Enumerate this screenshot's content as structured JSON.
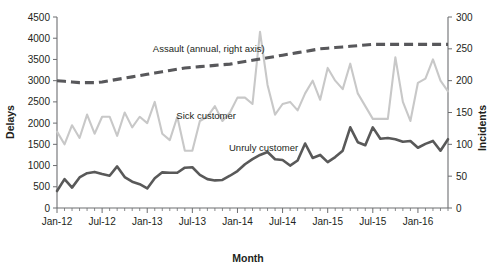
{
  "chart_data": {
    "type": "line",
    "title": "",
    "xlabel": "Month",
    "ylabel": "Delays",
    "y2label": "Incidents",
    "grid": false,
    "legend_position": "inline-annotations",
    "ylim": [
      0,
      4500
    ],
    "yticks": [
      "0",
      "500",
      "1000",
      "1500",
      "2000",
      "2500",
      "3000",
      "3500",
      "4000",
      "4500"
    ],
    "y2lim": [
      0,
      300
    ],
    "y2ticks": [
      "0",
      "50",
      "100",
      "150",
      "200",
      "250",
      "300"
    ],
    "xticks": [
      "Jan-12",
      "Jul-12",
      "Jan-13",
      "Jul-13",
      "Jan-14",
      "Jul-14",
      "Jan-15",
      "Jul-15",
      "Jan-16"
    ],
    "x_start": "Jan-12",
    "x_end": "May-16",
    "x_tick_interval_months": 6,
    "x_minor_tick_interval_months": 1,
    "n_points": 53,
    "annotations": [
      {
        "text": "Assault (annual, right axis)",
        "x_frac": 0.245,
        "y_frac": 0.185
      },
      {
        "text": "Sick customer",
        "x_frac": 0.305,
        "y_frac": 0.535
      },
      {
        "text": "Unruly customer",
        "x_frac": 0.44,
        "y_frac": 0.7
      }
    ],
    "series": [
      {
        "name": "Sick customer",
        "axis": "left",
        "color": "#c8c8c8",
        "style": "solid",
        "values": [
          1800,
          1500,
          1950,
          1650,
          2200,
          1750,
          2150,
          2150,
          1700,
          2250,
          1900,
          2150,
          2000,
          2500,
          1750,
          1600,
          2150,
          1350,
          1350,
          2050,
          2150,
          2400,
          2050,
          2250,
          2600,
          2600,
          2450,
          4150,
          2900,
          2200,
          2450,
          2500,
          2300,
          2700,
          3000,
          2550,
          3300,
          3000,
          2800,
          3400,
          2700,
          2400,
          2100,
          2100,
          2100,
          3550,
          2500,
          2050,
          2950,
          3050,
          3500,
          3000,
          2750
        ]
      },
      {
        "name": "Unruly customer",
        "axis": "left",
        "color": "#595959",
        "style": "solid",
        "values": [
          400,
          680,
          480,
          720,
          820,
          850,
          800,
          760,
          980,
          730,
          620,
          560,
          460,
          700,
          840,
          830,
          830,
          950,
          960,
          780,
          680,
          650,
          660,
          760,
          870,
          1030,
          1150,
          1250,
          1320,
          1150,
          1130,
          1000,
          1120,
          1520,
          1180,
          1250,
          1080,
          1200,
          1350,
          1900,
          1550,
          1480,
          1900,
          1630,
          1650,
          1620,
          1560,
          1580,
          1420,
          1510,
          1580,
          1350,
          1620
        ]
      },
      {
        "name": "Assault (annual, right axis)",
        "axis": "right",
        "color": "#58585b",
        "style": "dashed",
        "values": [
          200,
          199,
          198,
          197,
          197,
          197,
          198,
          200,
          202,
          204,
          206,
          208,
          210,
          212,
          214,
          216,
          218,
          220,
          221,
          222,
          223,
          224,
          225,
          226,
          228,
          230,
          232,
          234,
          236,
          238,
          240,
          242,
          244,
          246,
          248,
          250,
          251,
          252,
          253,
          254,
          255,
          256,
          257,
          257,
          257,
          257,
          257,
          257,
          257,
          257,
          257,
          257,
          257
        ]
      }
    ]
  }
}
